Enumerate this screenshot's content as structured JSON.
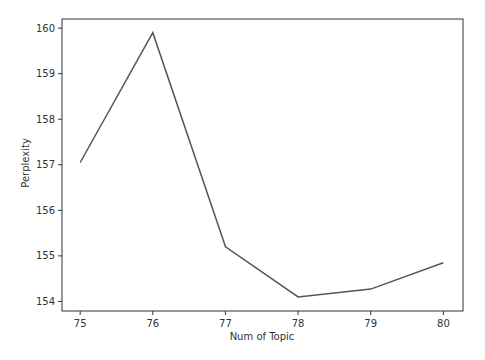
{
  "chart_data": {
    "type": "line",
    "title": "",
    "xlabel": "Num of Topic",
    "ylabel": "Perplexity",
    "x": [
      75,
      76,
      77,
      78,
      79,
      80
    ],
    "series": [
      {
        "name": "Perplexity",
        "values": [
          157.05,
          159.9,
          155.2,
          154.1,
          154.27,
          154.85
        ],
        "color": "#555555"
      }
    ],
    "xticks": [
      75,
      76,
      77,
      78,
      79,
      80
    ],
    "yticks": [
      154,
      155,
      156,
      157,
      158,
      159,
      160
    ],
    "xlim": [
      74.75,
      80.27
    ],
    "ylim": [
      153.79,
      160.2
    ],
    "grid": false,
    "legend": null
  }
}
